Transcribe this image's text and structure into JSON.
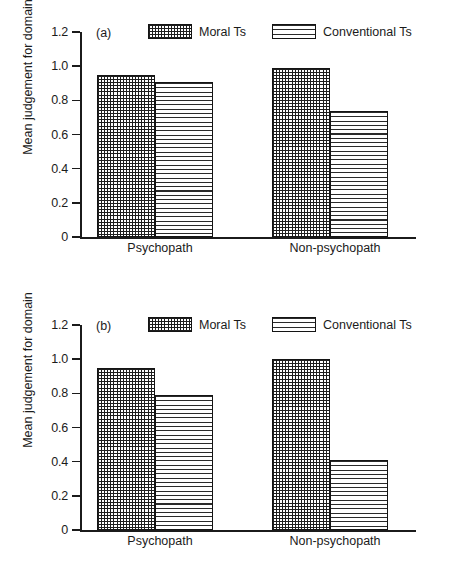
{
  "figure": {
    "axis_title": "Mean judgement for domain",
    "y_ticks": [
      "1.2",
      "1.0",
      "0.8",
      "0.6",
      "0.4",
      "0.2",
      "0"
    ],
    "y_tick_values": [
      1.2,
      1.0,
      0.8,
      0.6,
      0.4,
      0.2,
      0
    ],
    "categories": [
      "Psychopath",
      "Non-psychopath"
    ],
    "legend": [
      {
        "label": "Moral Ts",
        "pattern": "crosshatch-swatch"
      },
      {
        "label": "Conventional Ts",
        "pattern": "horizontal-lines-swatch"
      }
    ]
  },
  "panels": [
    {
      "id": "a",
      "label": "(a)"
    },
    {
      "id": "b",
      "label": "(b)"
    }
  ],
  "chart_data": [
    {
      "type": "bar",
      "title": "(a)",
      "xlabel": "",
      "ylabel": "Mean judgement for domain",
      "ylim": [
        0,
        1.2
      ],
      "yticks": [
        0,
        0.2,
        0.4,
        0.6,
        0.8,
        1.0,
        1.2
      ],
      "grid": false,
      "legend_position": "top-center",
      "categories": [
        "Psychopath",
        "Non-psychopath"
      ],
      "series": [
        {
          "name": "Moral Ts",
          "values": [
            0.95,
            0.99
          ]
        },
        {
          "name": "Conventional Ts",
          "values": [
            0.91,
            0.74
          ]
        }
      ]
    },
    {
      "type": "bar",
      "title": "(b)",
      "xlabel": "",
      "ylabel": "Mean judgement for domain",
      "ylim": [
        0,
        1.2
      ],
      "yticks": [
        0,
        0.2,
        0.4,
        0.6,
        0.8,
        1.0,
        1.2
      ],
      "grid": false,
      "legend_position": "top-center",
      "categories": [
        "Psychopath",
        "Non-psychopath"
      ],
      "series": [
        {
          "name": "Moral Ts",
          "values": [
            0.95,
            1.0
          ]
        },
        {
          "name": "Conventional Ts",
          "values": [
            0.79,
            0.41
          ]
        }
      ]
    }
  ]
}
